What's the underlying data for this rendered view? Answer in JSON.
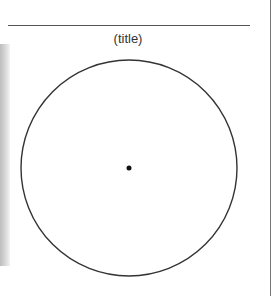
{
  "figure": {
    "title": "(title)",
    "circle": {
      "cx": 129,
      "cy": 168,
      "r": 108,
      "stroke": "#333333"
    },
    "center_point": {
      "cx": 129,
      "cy": 168,
      "r": 2.5,
      "fill": "#111111"
    }
  }
}
